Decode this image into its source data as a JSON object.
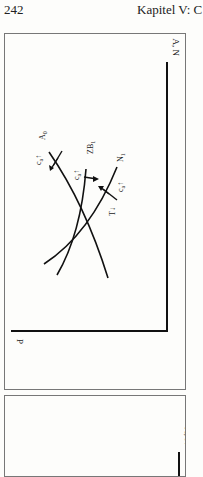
{
  "header": {
    "page_number": "242",
    "running_head": "Kapitel V: C"
  },
  "figure1": {
    "x_axis_label": "A, N",
    "y_axis_label": "P",
    "curves": [
      {
        "name": "A0",
        "label": "A",
        "sub": "0",
        "shift_label": "c",
        "shift_sub": "a",
        "shift_arrow": "↑"
      },
      {
        "name": "ZB1",
        "label": "ZB",
        "sub": "1",
        "shift_label": "c",
        "shift_sub": "a",
        "shift_arrow": "↑"
      },
      {
        "name": "N1",
        "label": "N",
        "sub": "1",
        "shift_label": "c",
        "shift_sub": "a",
        "shift_arrow": "↑",
        "extra_label": "T↓"
      }
    ]
  },
  "figure2": {
    "x_axis_label": "A, N"
  }
}
